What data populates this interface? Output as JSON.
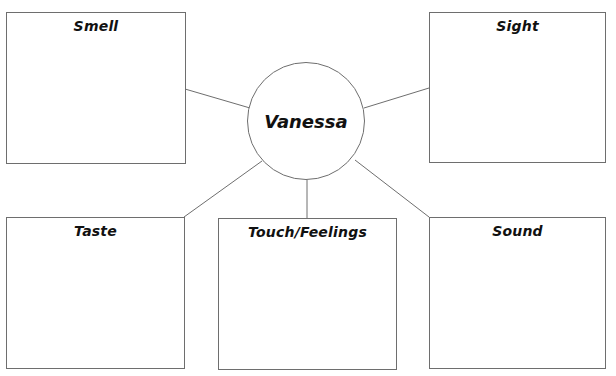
{
  "diagram": {
    "type": "five-senses-web",
    "center": {
      "label": "Vanessa",
      "cx": 306,
      "cy": 121,
      "r": 59
    },
    "boxes": [
      {
        "id": "smell",
        "label": "Smell",
        "x": 6,
        "y": 12,
        "w": 180,
        "h": 152
      },
      {
        "id": "sight",
        "label": "Sight",
        "x": 429,
        "y": 12,
        "w": 177,
        "h": 151
      },
      {
        "id": "taste",
        "label": "Taste",
        "x": 6,
        "y": 217,
        "w": 179,
        "h": 152
      },
      {
        "id": "touch",
        "label": "Touch/Feelings",
        "x": 218,
        "y": 218,
        "w": 179,
        "h": 152
      },
      {
        "id": "sound",
        "label": "Sound",
        "x": 429,
        "y": 217,
        "w": 177,
        "h": 152
      }
    ],
    "connectors": [
      {
        "from": "smell",
        "x1": 185,
        "y1": 89,
        "x2": 250,
        "y2": 108
      },
      {
        "from": "sight",
        "x1": 429,
        "y1": 88,
        "x2": 364,
        "y2": 108
      },
      {
        "from": "taste",
        "x1": 184,
        "y1": 217,
        "x2": 262,
        "y2": 161
      },
      {
        "from": "touch",
        "x1": 307,
        "y1": 180,
        "x2": 307,
        "y2": 218
      },
      {
        "from": "sound",
        "x1": 429,
        "y1": 217,
        "x2": 355,
        "y2": 160
      }
    ],
    "colors": {
      "stroke": "#6e6e6e",
      "text": "#111111",
      "background": "#ffffff"
    }
  }
}
